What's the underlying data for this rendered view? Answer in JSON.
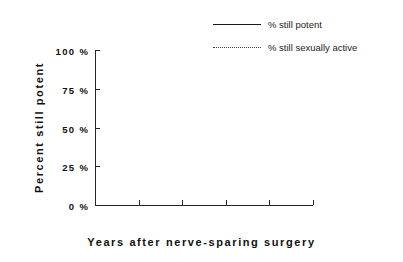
{
  "chart_data": {
    "type": "line",
    "title": "",
    "xlabel": "Years after nerve-sparing surgery",
    "ylabel": "Percent still potent",
    "xlim": [
      0,
      10
    ],
    "ylim": [
      0,
      100
    ],
    "grid": false,
    "legend_position": "top-right",
    "x_tick_labels": [
      "0",
      "2",
      "4",
      "6",
      "8",
      "1 0"
    ],
    "x_tick_values": [
      0,
      2,
      4,
      6,
      8,
      10
    ],
    "y_tick_labels": [
      "100 %",
      "75 %",
      "50 %",
      "25 %",
      "0 %"
    ],
    "y_tick_values": [
      100,
      75,
      50,
      25,
      0
    ],
    "series": [
      {
        "name": "% still potent",
        "style": "solid",
        "color": "#1c1c1c",
        "x": [],
        "values": []
      },
      {
        "name": "% still sexually active",
        "style": "dotted",
        "color": "#3a3a3a",
        "x": [],
        "values": []
      }
    ],
    "annotations": [],
    "note": "Plot area is empty; no data points are drawn for either series."
  },
  "legend": {
    "entries": [
      {
        "label": "% still potent",
        "style": "solid"
      },
      {
        "label": "% still sexually active",
        "style": "dotted"
      }
    ]
  },
  "axes": {
    "y_title": "Percent still potent",
    "x_title": "Years after nerve-sparing surgery"
  }
}
